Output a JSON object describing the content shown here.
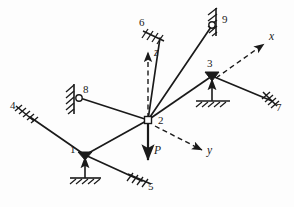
{
  "figure": {
    "stroke_color": "#1a1a1a",
    "background_color": "#fdfdfd"
  },
  "nodes": [
    {
      "id": "1",
      "label": "1",
      "x": 85,
      "y": 155,
      "label_x": 71,
      "label_y": 150,
      "joint": "solid-triangle",
      "support": "roller-ground-up"
    },
    {
      "id": "2",
      "label": "2",
      "x": 148,
      "y": 120,
      "label_x": 158,
      "label_y": 121,
      "joint": "open-square",
      "support": "none"
    },
    {
      "id": "3",
      "label": "3",
      "x": 212,
      "y": 76,
      "label_x": 207,
      "label_y": 64,
      "joint": "solid-triangle",
      "support": "roller-ground-up"
    },
    {
      "id": "4",
      "label": "4",
      "x": 28,
      "y": 116,
      "label_x": 12,
      "label_y": 106,
      "joint": "none",
      "support": "hatch-angled-left"
    },
    {
      "id": "5",
      "label": "5",
      "x": 140,
      "y": 181,
      "label_x": 148,
      "label_y": 186,
      "joint": "none",
      "support": "hatch-angled-bottom"
    },
    {
      "id": "6",
      "label": "6",
      "x": 155,
      "y": 34,
      "label_x": 141,
      "label_y": 22,
      "joint": "none",
      "support": "hatch-angled-top"
    },
    {
      "id": "7",
      "label": "7",
      "x": 272,
      "y": 100,
      "label_x": 276,
      "label_y": 104,
      "joint": "none",
      "support": "hatch-angled-right"
    },
    {
      "id": "8",
      "label": "8",
      "x": 78,
      "y": 97,
      "label_x": 84,
      "label_y": 88,
      "joint": "open-circle",
      "support": "hatch-wall-vertical"
    },
    {
      "id": "9",
      "label": "9",
      "x": 213,
      "y": 24,
      "label_x": 223,
      "label_y": 19,
      "joint": "open-circle",
      "support": "hatch-wall-vertical"
    }
  ],
  "members": [
    {
      "name": "member-4-1",
      "from": "4",
      "to": "1"
    },
    {
      "name": "member-1-5",
      "from": "1",
      "to": "5"
    },
    {
      "name": "member-1-2",
      "from": "1",
      "to": "2"
    },
    {
      "name": "member-8-2",
      "from": "8",
      "to": "2"
    },
    {
      "name": "member-6-2",
      "from": "6",
      "to": "2"
    },
    {
      "name": "member-9-2",
      "from": "9",
      "to": "2"
    },
    {
      "name": "member-2-3",
      "from": "2",
      "to": "3"
    },
    {
      "name": "member-3-7",
      "from": "3",
      "to": "7"
    }
  ],
  "axes": [
    {
      "name": "z-axis",
      "label": "z",
      "from_x": 148,
      "from_y": 120,
      "to_x": 148,
      "to_y": 49,
      "label_x": 154,
      "label_y": 52,
      "style": "dashed"
    },
    {
      "name": "y-axis",
      "label": "y",
      "from_x": 152,
      "from_y": 124,
      "to_x": 206,
      "to_y": 152,
      "label_x": 211,
      "label_y": 150,
      "style": "dashed"
    },
    {
      "name": "x-axis",
      "label": "x",
      "from_x": 214,
      "from_y": 77,
      "to_x": 268,
      "to_y": 41,
      "label_x": 272,
      "label_y": 36,
      "style": "dashed"
    }
  ],
  "load": {
    "name": "applied-load-P",
    "label": "P",
    "from_x": 148,
    "from_y": 120,
    "to_x": 148,
    "to_y": 163,
    "label_x": 155,
    "label_y": 151,
    "direction": "down"
  },
  "support_reactions": [
    {
      "name": "reaction-at-node-1",
      "x": 85,
      "y": 155,
      "arrow_to_y": 155,
      "base_y": 182,
      "width": 32
    },
    {
      "name": "reaction-at-node-3",
      "x": 212,
      "y": 76,
      "arrow_to_y": 76,
      "base_y": 105,
      "width": 38
    }
  ]
}
